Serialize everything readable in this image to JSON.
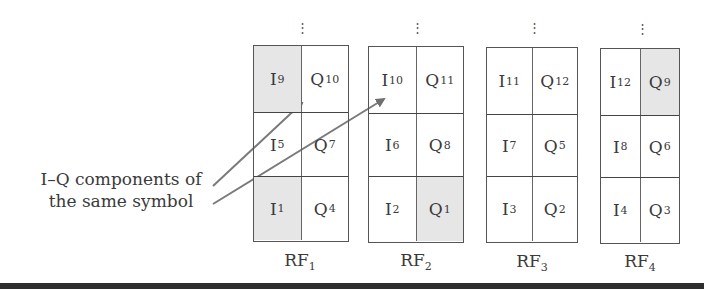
{
  "caption": {
    "line1": "I–Q components of",
    "line2": "the same symbol"
  },
  "colors": {
    "shaded": "#e6e6e6",
    "arrow": "#7a7a7a",
    "border": "#555555",
    "bottom_bar": "#2e2e2e"
  },
  "continuation_marker": "⋮",
  "blocks": [
    {
      "label": "RF",
      "label_sub": "1",
      "rows": [
        [
          {
            "base": "I",
            "sub": "9",
            "shaded": true
          },
          {
            "base": "Q",
            "sub": "10",
            "shaded": false
          }
        ],
        [
          {
            "base": "I",
            "sub": "5",
            "shaded": false
          },
          {
            "base": "Q",
            "sub": "7",
            "shaded": false
          }
        ],
        [
          {
            "base": "I",
            "sub": "1",
            "shaded": true
          },
          {
            "base": "Q",
            "sub": "4",
            "shaded": false
          }
        ]
      ]
    },
    {
      "label": "RF",
      "label_sub": "2",
      "rows": [
        [
          {
            "base": "I",
            "sub": "10",
            "shaded": false
          },
          {
            "base": "Q",
            "sub": "11",
            "shaded": false
          }
        ],
        [
          {
            "base": "I",
            "sub": "6",
            "shaded": false
          },
          {
            "base": "Q",
            "sub": "8",
            "shaded": false
          }
        ],
        [
          {
            "base": "I",
            "sub": "2",
            "shaded": false
          },
          {
            "base": "Q",
            "sub": "1",
            "shaded": true
          }
        ]
      ]
    },
    {
      "label": "RF",
      "label_sub": "3",
      "rows": [
        [
          {
            "base": "I",
            "sub": "11",
            "shaded": false
          },
          {
            "base": "Q",
            "sub": "12",
            "shaded": false
          }
        ],
        [
          {
            "base": "I",
            "sub": "7",
            "shaded": false
          },
          {
            "base": "Q",
            "sub": "5",
            "shaded": false
          }
        ],
        [
          {
            "base": "I",
            "sub": "3",
            "shaded": false
          },
          {
            "base": "Q",
            "sub": "2",
            "shaded": false
          }
        ]
      ]
    },
    {
      "label": "RF",
      "label_sub": "4",
      "rows": [
        [
          {
            "base": "I",
            "sub": "12",
            "shaded": false
          },
          {
            "base": "Q",
            "sub": "9",
            "shaded": true
          }
        ],
        [
          {
            "base": "I",
            "sub": "8",
            "shaded": false
          },
          {
            "base": "Q",
            "sub": "6",
            "shaded": false
          }
        ],
        [
          {
            "base": "I",
            "sub": "4",
            "shaded": false
          },
          {
            "base": "Q",
            "sub": "3",
            "shaded": false
          }
        ]
      ]
    }
  ]
}
